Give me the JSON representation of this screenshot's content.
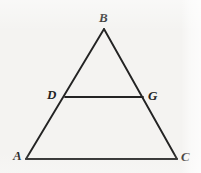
{
  "figure": {
    "kind": "geometry-diagram",
    "background_color": "#f4f3f1",
    "stroke_color": "#232323",
    "label_color": "#232323",
    "canvas": {
      "width": 201,
      "height": 173
    },
    "points": {
      "A": {
        "x": 26,
        "y": 159
      },
      "B": {
        "x": 104,
        "y": 29
      },
      "C": {
        "x": 177,
        "y": 159
      },
      "D": {
        "x": 65,
        "y": 97
      },
      "G": {
        "x": 143,
        "y": 97
      }
    },
    "segments": [
      {
        "name": "AB",
        "from": "A",
        "to": "B"
      },
      {
        "name": "BC",
        "from": "B",
        "to": "C"
      },
      {
        "name": "AC",
        "from": "A",
        "to": "C"
      },
      {
        "name": "DG",
        "from": "D",
        "to": "G"
      }
    ],
    "labels": [
      {
        "id": "B",
        "text": "B",
        "x": 99,
        "y": 11
      },
      {
        "id": "D",
        "text": "D",
        "x": 47,
        "y": 88
      },
      {
        "id": "G",
        "text": "G",
        "x": 148,
        "y": 89
      },
      {
        "id": "A",
        "text": "A",
        "x": 13,
        "y": 149
      },
      {
        "id": "C",
        "text": "C",
        "x": 181,
        "y": 150
      }
    ]
  }
}
